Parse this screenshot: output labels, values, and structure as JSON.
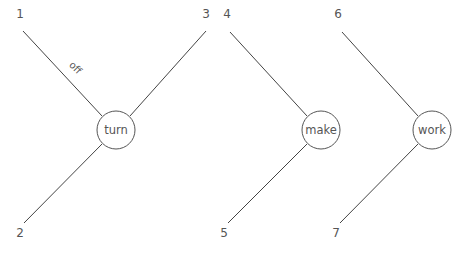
{
  "diagram": {
    "type": "dependency-tree",
    "nodes": [
      {
        "id": "turn",
        "label": "turn",
        "cx": 116,
        "cy": 130,
        "r": 19
      },
      {
        "id": "make",
        "label": "make",
        "cx": 321,
        "cy": 130,
        "r": 19
      },
      {
        "id": "work",
        "label": "work",
        "cx": 432,
        "cy": 130,
        "r": 19
      }
    ],
    "leaves": [
      {
        "id": "1",
        "label": "1",
        "x": 20,
        "y": 18
      },
      {
        "id": "2",
        "label": "2",
        "x": 20,
        "y": 237
      },
      {
        "id": "3",
        "label": "3",
        "x": 206,
        "y": 18
      },
      {
        "id": "4",
        "label": "4",
        "x": 227,
        "y": 18
      },
      {
        "id": "5",
        "label": "5",
        "x": 224,
        "y": 237
      },
      {
        "id": "6",
        "label": "6",
        "x": 338,
        "y": 18
      },
      {
        "id": "7",
        "label": "7",
        "x": 336,
        "y": 237
      }
    ],
    "edges": [
      {
        "from": "1",
        "to": "turn",
        "x1": 23,
        "y1": 31,
        "x2": 102,
        "y2": 116,
        "label": "off"
      },
      {
        "from": "3",
        "to": "turn",
        "x1": 206,
        "y1": 31,
        "x2": 130,
        "y2": 116,
        "label": ""
      },
      {
        "from": "2",
        "to": "turn",
        "x1": 24,
        "y1": 223,
        "x2": 102,
        "y2": 144,
        "label": ""
      },
      {
        "from": "4",
        "to": "make",
        "x1": 230,
        "y1": 32,
        "x2": 307,
        "y2": 116,
        "label": ""
      },
      {
        "from": "5",
        "to": "make",
        "x1": 228,
        "y1": 223,
        "x2": 307,
        "y2": 144,
        "label": ""
      },
      {
        "from": "6",
        "to": "work",
        "x1": 342,
        "y1": 32,
        "x2": 418,
        "y2": 116,
        "label": ""
      },
      {
        "from": "7",
        "to": "work",
        "x1": 340,
        "y1": 223,
        "x2": 418,
        "y2": 144,
        "label": ""
      }
    ],
    "edge_labels": [
      {
        "text": "off",
        "x": 73,
        "y": 70,
        "rotate": 45
      }
    ],
    "colors": {
      "line": "#444444",
      "text": "#555555",
      "background": "#ffffff"
    }
  }
}
